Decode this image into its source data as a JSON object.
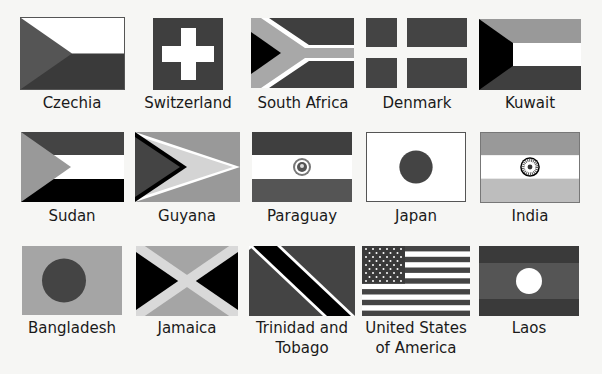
{
  "colors": {
    "dark": "#3f3f3f",
    "mid": "#999999",
    "light": "#c8c8c8",
    "white": "#ffffff",
    "black": "#000000",
    "background": "#f6f6f4"
  },
  "flags": [
    {
      "name": "Czechia",
      "row": 0,
      "col": 0
    },
    {
      "name": "Switzerland",
      "row": 0,
      "col": 1
    },
    {
      "name": "South Africa",
      "row": 0,
      "col": 2
    },
    {
      "name": "Denmark",
      "row": 0,
      "col": 3
    },
    {
      "name": "Kuwait",
      "row": 0,
      "col": 4
    },
    {
      "name": "Sudan",
      "row": 1,
      "col": 0
    },
    {
      "name": "Guyana",
      "row": 1,
      "col": 1
    },
    {
      "name": "Paraguay",
      "row": 1,
      "col": 2
    },
    {
      "name": "Japan",
      "row": 1,
      "col": 3
    },
    {
      "name": "India",
      "row": 1,
      "col": 4
    },
    {
      "name": "Bangladesh",
      "row": 2,
      "col": 0
    },
    {
      "name": "Jamaica",
      "row": 2,
      "col": 1
    },
    {
      "name": "Trinidad and Tobago",
      "row": 2,
      "col": 2,
      "lines": [
        "Trinidad and",
        "Tobago"
      ]
    },
    {
      "name": "United States of America",
      "row": 2,
      "col": 3,
      "lines": [
        "United States",
        "of America"
      ]
    },
    {
      "name": "Laos",
      "row": 2,
      "col": 4
    }
  ]
}
